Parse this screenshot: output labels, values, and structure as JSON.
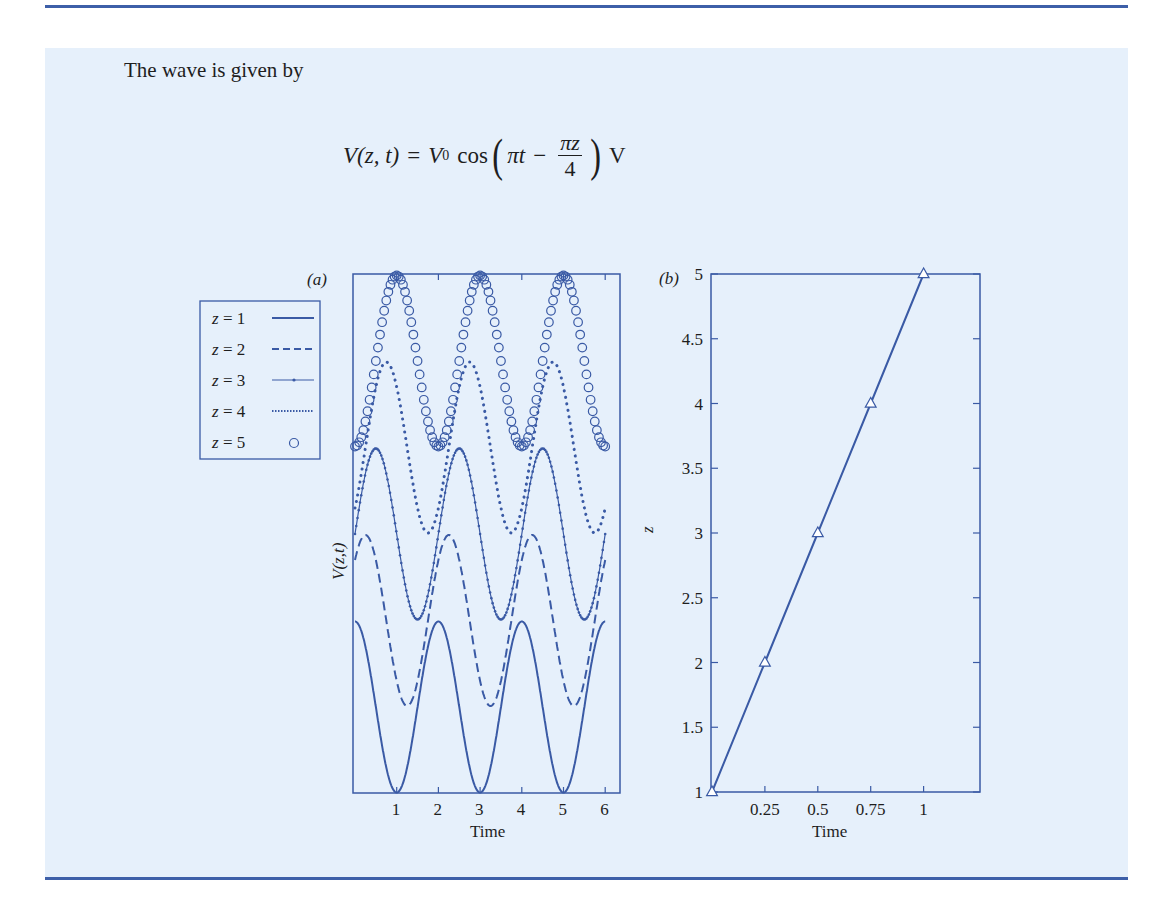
{
  "text": {
    "intro": "The wave is given by",
    "equation": {
      "lhs": "V(z, t)",
      "equals": "=",
      "amplitude": "V",
      "amplitude_sub": "0",
      "func": "cos",
      "term1": "πt",
      "minus": "−",
      "frac_num": "πz",
      "frac_den": "4",
      "unit": "V"
    }
  },
  "colors": {
    "accent": "#3d5fa8",
    "curve": "#3a5aa5",
    "background": "#e6f0fb",
    "text": "#1e1e1e"
  },
  "chart_data": [
    {
      "type": "line",
      "panel_label": "(a)",
      "title": "",
      "xlabel": "Time",
      "ylabel": "V(z,t)",
      "xlim": [
        0,
        6
      ],
      "xticks": [
        1,
        2,
        3,
        4,
        5,
        6
      ],
      "yticks": [],
      "grid": false,
      "legend_position": "outside-left",
      "description": "V(z,t) = V0 cos(πt − πz/4) for z = 1..5, each curve offset vertically",
      "series": [
        {
          "name": "z = 1",
          "z": 1,
          "style": "solid",
          "phase_shift_t": 0.0,
          "peaks_t": [
            0,
            2,
            4,
            6
          ],
          "troughs_t": [
            1,
            3,
            5
          ]
        },
        {
          "name": "z = 2",
          "z": 2,
          "style": "dashed",
          "phase_shift_t": 0.25,
          "peaks_t": [
            0.25,
            2.25,
            4.25
          ],
          "troughs_t": [
            1.25,
            3.25,
            5.25
          ]
        },
        {
          "name": "z = 3",
          "z": 3,
          "style": "solid-dotted-marker",
          "phase_shift_t": 0.5,
          "peaks_t": [
            0.5,
            2.5,
            4.5
          ],
          "troughs_t": [
            1.5,
            3.5,
            5.5
          ]
        },
        {
          "name": "z = 4",
          "z": 4,
          "style": "dotted",
          "phase_shift_t": 0.75,
          "peaks_t": [
            0.75,
            2.75,
            4.75
          ],
          "troughs_t": [
            1.75,
            3.75,
            5.75
          ]
        },
        {
          "name": "z = 5",
          "z": 5,
          "style": "circles",
          "phase_shift_t": 1.0,
          "peaks_t": [
            1,
            3,
            5
          ],
          "troughs_t": [
            0,
            2,
            4,
            6
          ]
        }
      ]
    },
    {
      "type": "line",
      "panel_label": "(b)",
      "title": "",
      "xlabel": "Time",
      "ylabel": "z",
      "xlim": [
        0,
        1.1
      ],
      "ylim": [
        1,
        5
      ],
      "xticks": [
        "0.25",
        "0.5",
        "0.75",
        "1"
      ],
      "yticks": [
        "1",
        "1.5",
        "2",
        "2.5",
        "3",
        "3.5",
        "4",
        "4.5",
        "5"
      ],
      "grid": false,
      "marker": "triangle",
      "x": [
        0,
        0.25,
        0.5,
        0.75,
        1
      ],
      "values": [
        1,
        2,
        3,
        4,
        5
      ]
    }
  ]
}
